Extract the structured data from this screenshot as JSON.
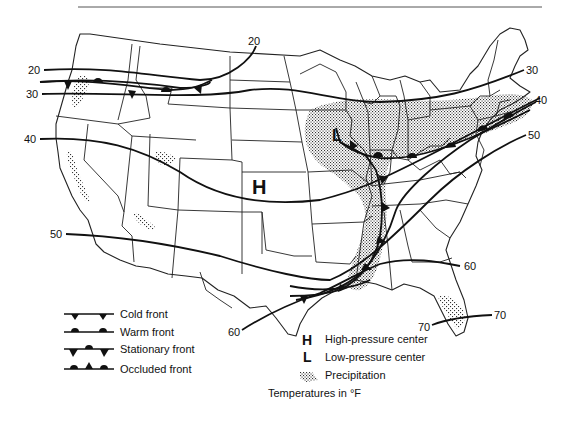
{
  "isotherms": {
    "unit_note": "Temperatures in °F",
    "labels": [
      {
        "id": "iso-20-west",
        "value": "20"
      },
      {
        "id": "iso-20-north",
        "value": "20"
      },
      {
        "id": "iso-30-west",
        "value": "30"
      },
      {
        "id": "iso-30-east",
        "value": "30"
      },
      {
        "id": "iso-40-west",
        "value": "40"
      },
      {
        "id": "iso-40-east",
        "value": "40"
      },
      {
        "id": "iso-50-west",
        "value": "50"
      },
      {
        "id": "iso-50-east",
        "value": "50"
      },
      {
        "id": "iso-60-south",
        "value": "60"
      },
      {
        "id": "iso-60-east",
        "value": "60"
      },
      {
        "id": "iso-70-west",
        "value": "70"
      },
      {
        "id": "iso-70-east",
        "value": "70"
      }
    ]
  },
  "pressure_centers": {
    "high": {
      "symbol": "H",
      "location": "Kansas/Nebraska"
    },
    "low": {
      "symbol": "L",
      "location": "Iowa/Missouri"
    }
  },
  "legend": {
    "fronts": [
      {
        "label": "Cold front",
        "symbol": "cold-front"
      },
      {
        "label": "Warm front",
        "symbol": "warm-front"
      },
      {
        "label": "Stationary front",
        "symbol": "stationary-front"
      },
      {
        "label": "Occluded front",
        "symbol": "occluded-front"
      }
    ],
    "markers": [
      {
        "symbol": "H",
        "label": "High-pressure center"
      },
      {
        "symbol": "L",
        "label": "Low-pressure center"
      },
      {
        "symbol": "precip",
        "label": "Precipitation"
      }
    ],
    "footnote": "Temperatures in °F"
  },
  "colors": {
    "ink": "#111111",
    "background": "#ffffff",
    "precip_dot": "#333333"
  }
}
